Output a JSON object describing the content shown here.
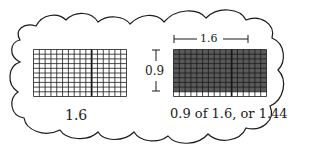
{
  "diagram": {
    "left_panel": {
      "label": "1.6",
      "grid": {
        "columns": 16,
        "rows": 10,
        "shaded_rows": 0,
        "shaded_cols": 0,
        "divider_after_col": 10
      }
    },
    "right_panel": {
      "width_label": "1.6",
      "height_label": "0.9",
      "caption": "0.9 of 1.6, or 1.44",
      "grid": {
        "columns": 16,
        "rows": 10,
        "shaded_rows": 9,
        "shaded_cols": 16,
        "divider_after_col": 10
      }
    },
    "colors": {
      "line": "#1a1a1a",
      "shade": "#5a5a5a",
      "background": "#ffffff"
    }
  }
}
